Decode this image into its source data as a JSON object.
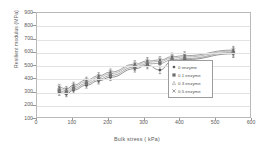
{
  "chart_data": {
    "type": "scatter",
    "title": "",
    "xlabel": "Bulk stress ( kPa)",
    "ylabel": "Resilient modulus (MPa)",
    "xlim": [
      0,
      600
    ],
    "ylim": [
      100,
      900
    ],
    "xticks": [
      0,
      100,
      200,
      300,
      400,
      500,
      600
    ],
    "yticks": [
      100,
      200,
      300,
      400,
      500,
      600,
      700,
      800,
      900
    ],
    "grid": "horizontal",
    "legend_position": "lower-right-inside",
    "errorbars": "vertical",
    "series": [
      {
        "name": "0 enzyme",
        "marker": "diamond",
        "color": "#4a4a4a",
        "x": [
          62,
          82,
          102,
          138,
          172,
          205,
          273,
          308,
          343,
          377,
          412,
          548
        ],
        "y": [
          300,
          288,
          318,
          355,
          388,
          415,
          480,
          505,
          470,
          538,
          548,
          592
        ],
        "yerr": [
          22,
          20,
          22,
          22,
          24,
          24,
          26,
          26,
          28,
          28,
          30,
          28
        ]
      },
      {
        "name": "0.1 enzyme",
        "marker": "square",
        "color": "#6e6e6e",
        "x": [
          62,
          82,
          102,
          138,
          172,
          205,
          273,
          308,
          343,
          377,
          412,
          548
        ],
        "y": [
          312,
          300,
          330,
          368,
          400,
          428,
          492,
          516,
          520,
          548,
          556,
          602
        ],
        "yerr": [
          22,
          20,
          22,
          22,
          24,
          24,
          26,
          26,
          26,
          28,
          30,
          28
        ]
      },
      {
        "name": "0.3 enzyme",
        "marker": "triangle",
        "color": "#8c8c8c",
        "x": [
          62,
          82,
          102,
          138,
          172,
          205,
          273,
          308,
          343,
          377,
          412,
          548
        ],
        "y": [
          326,
          314,
          344,
          382,
          414,
          442,
          504,
          528,
          534,
          560,
          568,
          612
        ],
        "yerr": [
          22,
          20,
          22,
          22,
          24,
          24,
          26,
          26,
          26,
          28,
          30,
          28
        ]
      },
      {
        "name": "0.5 enzyme",
        "marker": "cross",
        "color": "#5f5f5f",
        "x": [
          62,
          82,
          102,
          138,
          172,
          205,
          273,
          308,
          343,
          377,
          412,
          548
        ],
        "y": [
          340,
          326,
          356,
          394,
          426,
          454,
          514,
          538,
          545,
          570,
          578,
          620
        ],
        "yerr": [
          22,
          20,
          22,
          22,
          24,
          24,
          26,
          26,
          26,
          28,
          30,
          28
        ]
      }
    ]
  }
}
